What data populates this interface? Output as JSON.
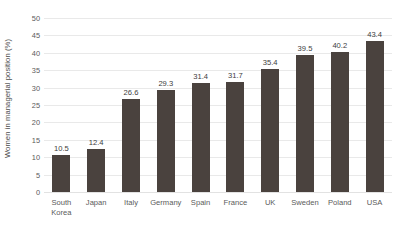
{
  "chart_data": {
    "type": "bar",
    "title": "",
    "xlabel": "",
    "ylabel": "Women in managerial position (%)",
    "ylim": [
      0,
      50
    ],
    "ytick_step": 5,
    "yticks": [
      0,
      5,
      10,
      15,
      20,
      25,
      30,
      35,
      40,
      45,
      50
    ],
    "grid": true,
    "legend": false,
    "categories": [
      "South Korea",
      "Japan",
      "Italy",
      "Germany",
      "Spain",
      "France",
      "UK",
      "Sweden",
      "Poland",
      "USA"
    ],
    "category_lines": [
      [
        "South",
        "Korea"
      ],
      [
        "Japan",
        ""
      ],
      [
        "Italy",
        ""
      ],
      [
        "Germany",
        ""
      ],
      [
        "Spain",
        ""
      ],
      [
        "France",
        ""
      ],
      [
        "UK",
        ""
      ],
      [
        "Sweden",
        ""
      ],
      [
        "Poland",
        ""
      ],
      [
        "USA",
        ""
      ]
    ],
    "values": [
      10.5,
      12.4,
      26.6,
      29.3,
      31.4,
      31.7,
      35.4,
      39.5,
      40.2,
      43.4
    ],
    "value_labels": [
      "10.5",
      "12.4",
      "26.6",
      "29.3",
      "31.4",
      "31.7",
      "35.4",
      "39.5",
      "40.2",
      "43.4"
    ],
    "bar_color": "#4a423e",
    "grid_color": "#e9e9e9",
    "text_color": "#5a5a5a",
    "background": "#ffffff"
  }
}
